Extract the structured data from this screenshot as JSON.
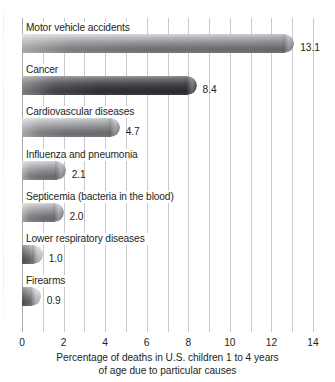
{
  "chart_data": {
    "type": "bar",
    "orientation": "horizontal",
    "title": "",
    "subtitle": "",
    "xlabel_line1": "Percentage of deaths in U.S. children 1 to 4 years",
    "xlabel_line2": "of age due to particular causes",
    "ylabel": "",
    "xlim": [
      0,
      14
    ],
    "grid": true,
    "grid_axis": "x",
    "legend": "none",
    "tick_labels": [
      "0",
      "2",
      "4",
      "6",
      "8",
      "10",
      "12",
      "14"
    ],
    "tick_values": [
      0,
      2,
      4,
      6,
      8,
      10,
      12,
      14
    ],
    "gridline_values": [
      0,
      1,
      2,
      3,
      4,
      5,
      6,
      7,
      8,
      9,
      10,
      11,
      12,
      13,
      14
    ],
    "categories": [
      "Motor vehicle accidents",
      "Cancer",
      "Cardiovascular diseases",
      "Influenza and pneumonia",
      "Septicemia (bacteria in the blood)",
      "Lower respiratory diseases",
      "Firearms"
    ],
    "values": [
      13.1,
      8.4,
      4.7,
      2.1,
      2.0,
      1.0,
      0.9
    ],
    "value_labels": [
      "13.1",
      "8.4",
      "4.7",
      "2.1",
      "2.0",
      "1.0",
      "0.9"
    ],
    "bars": [
      {
        "label": "Motor vehicle accidents",
        "value": 13.1,
        "value_label": "13.1",
        "style": "light"
      },
      {
        "label": "Cancer",
        "value": 8.4,
        "value_label": "8.4",
        "style": "dark"
      },
      {
        "label": "Cardiovascular diseases",
        "value": 4.7,
        "value_label": "4.7",
        "style": "light"
      },
      {
        "label": "Influenza and pneumonia",
        "value": 2.1,
        "value_label": "2.1",
        "style": "light"
      },
      {
        "label": "Septicemia (bacteria in the blood)",
        "value": 2.0,
        "value_label": "2.0",
        "style": "light"
      },
      {
        "label": "Lower respiratory diseases",
        "value": 1.0,
        "value_label": "1.0",
        "style": "short"
      },
      {
        "label": "Firearms",
        "value": 0.9,
        "value_label": "0.9",
        "style": "short"
      }
    ],
    "colors": {
      "bar_light_top": "#d9dadb",
      "bar_light_bottom": "#6c6e71",
      "bar_dark_top": "#9b9da0",
      "bar_dark_bottom": "#2c2e31",
      "gridline": "#c9cacb",
      "axis_line": "#a7a9ac",
      "text": "#231f20",
      "background": "#ffffff"
    }
  }
}
